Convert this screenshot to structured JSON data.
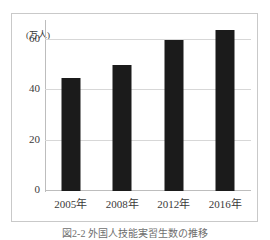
{
  "chart_data": {
    "type": "bar",
    "title": "",
    "xlabel": "",
    "ylabel": "",
    "unit_label": "(万人)",
    "categories": [
      "2005年",
      "2008年",
      "2012年",
      "2016年"
    ],
    "values": [
      45,
      50,
      60,
      64
    ],
    "series": [
      {
        "name": "",
        "values": [
          45,
          50,
          60,
          64
        ]
      }
    ],
    "ylim": [
      0,
      68
    ],
    "yticks": [
      0,
      20,
      40,
      60
    ],
    "ytick_labels": [
      "0",
      "20",
      "40",
      "60"
    ],
    "grid": true,
    "legend": "none",
    "bar_color": "#1b1b1b",
    "grid_color": "#d7d7d7",
    "axis_color": "#bdbdbd",
    "frame_color": "#c9c9c9"
  },
  "figure": {
    "caption": "図2-2 外国人技能実習生数の推移"
  }
}
